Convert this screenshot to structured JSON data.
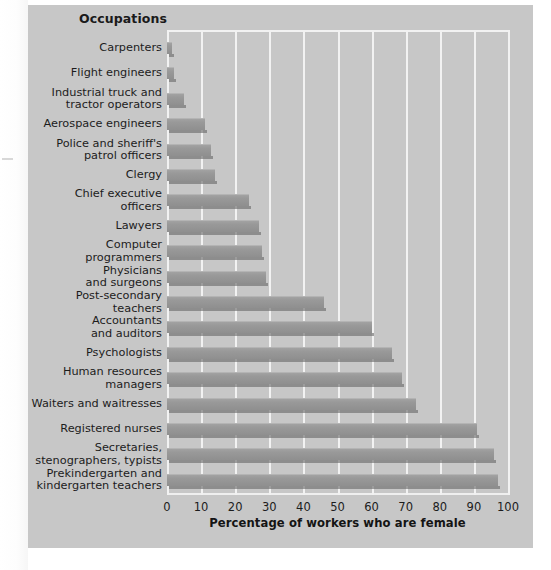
{
  "panel": {
    "header_label": "Occupations",
    "background_color": "#c7c7c7",
    "gridline_color": "#f2f2f2",
    "bar_color": "#999999"
  },
  "chart_data": {
    "type": "bar",
    "orientation": "horizontal",
    "title": "",
    "xlabel": "Percentage of workers who are female",
    "ylabel": "Occupations",
    "xlim": [
      0,
      100
    ],
    "xticks": [
      0,
      10,
      20,
      30,
      40,
      50,
      60,
      70,
      80,
      90,
      100
    ],
    "xtick_labels": [
      "0",
      "10",
      "20",
      "30",
      "40",
      "50",
      "60",
      "70",
      "80",
      "90",
      "100"
    ],
    "grid": "vertical",
    "legend": "none",
    "categories": [
      "Carpenters",
      "Flight engineers",
      "Industrial truck and\ntractor operators",
      "Aerospace engineers",
      "Police and sheriff's\npatrol officers",
      "Clergy",
      "Chief executive\nofficers",
      "Lawyers",
      "Computer\nprogrammers",
      "Physicians\nand surgeons",
      "Post-secondary\nteachers",
      "Accountants\nand auditors",
      "Psychologists",
      "Human resources\nmanagers",
      "Waiters and waitresses",
      "Registered nurses",
      "Secretaries,\nstenographers, typists",
      "Prekindergarten and\nkindergarten teachers"
    ],
    "values": [
      1.5,
      2,
      5,
      11,
      13,
      14,
      24,
      27,
      28,
      29,
      46,
      60,
      66,
      69,
      73,
      91,
      96,
      97
    ]
  }
}
